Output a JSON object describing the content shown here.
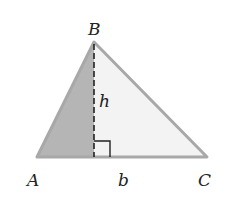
{
  "diagram": {
    "vertices": {
      "A": {
        "label": "A",
        "x": 37,
        "y": 157
      },
      "B": {
        "label": "B",
        "x": 94,
        "y": 42
      },
      "C": {
        "label": "C",
        "x": 207,
        "y": 157
      }
    },
    "labels": {
      "A": "A",
      "B": "B",
      "C": "C",
      "height": "h",
      "base": "b"
    },
    "colors": {
      "edge": "#a8a8a8",
      "shaded_fill": "#b5b5b5",
      "light_fill": "#f3f3f3",
      "altitude": "#222222",
      "text": "#222222"
    }
  }
}
